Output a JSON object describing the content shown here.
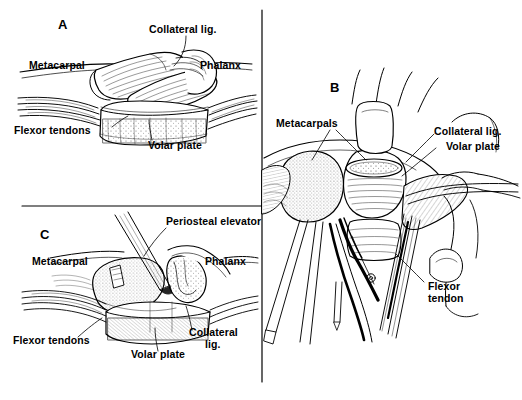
{
  "figure": {
    "background_color": "#ffffff",
    "ink_color": "#000000",
    "width": 522,
    "height": 400
  },
  "panels": [
    {
      "id": "A",
      "letter": "A",
      "caption": "Lateral view of metacarpophalangeal joint",
      "labels": [
        {
          "id": "a-collateral",
          "text": "Collateral lig."
        },
        {
          "id": "a-metacarpal",
          "text": "Metacarpal"
        },
        {
          "id": "a-phalanx",
          "text": "Phalanx"
        },
        {
          "id": "a-flexor",
          "text": "Flexor tendons"
        },
        {
          "id": "a-volar",
          "text": "Volar plate"
        }
      ]
    },
    {
      "id": "B",
      "letter": "B",
      "caption": "Operative exposure of metacarpal heads with retractors",
      "labels": [
        {
          "id": "b-metacarpals",
          "text": "Metacarpals"
        },
        {
          "id": "b-collateral",
          "text": "Collateral lig."
        },
        {
          "id": "b-volar",
          "text": "Volar plate"
        },
        {
          "id": "b-flexor-line1",
          "text": "Flexor"
        },
        {
          "id": "b-flexor-line2",
          "text": "tendon"
        }
      ]
    },
    {
      "id": "C",
      "letter": "C",
      "caption": "Periosteal elevator releasing the volar plate",
      "labels": [
        {
          "id": "c-periosteal",
          "text": "Periosteal elevator"
        },
        {
          "id": "c-metacarpal",
          "text": "Metacarpal"
        },
        {
          "id": "c-phalanx",
          "text": "Phalanx"
        },
        {
          "id": "c-flexor",
          "text": "Flexor tendons"
        },
        {
          "id": "c-volar",
          "text": "Volar plate"
        },
        {
          "id": "c-collateral-line1",
          "text": "Collateral"
        },
        {
          "id": "c-collateral-line2",
          "text": "lig."
        }
      ]
    }
  ]
}
